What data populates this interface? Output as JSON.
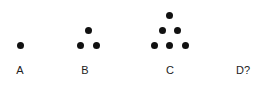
{
  "diagram": {
    "type": "triangular-number-sequence",
    "figures": [
      {
        "label": "A",
        "dots": 1,
        "label_x": 19
      },
      {
        "label": "B",
        "dots": 3,
        "label_x": 85
      },
      {
        "label": "C",
        "dots": 6,
        "label_x": 170
      },
      {
        "label": "D?",
        "dots": null,
        "label_x": 243
      }
    ],
    "dot_color": "#111111"
  }
}
